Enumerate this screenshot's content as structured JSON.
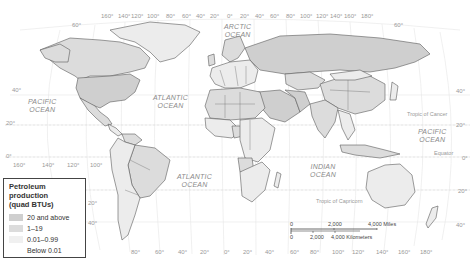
{
  "map": {
    "type": "world political map (petroleum production choropleth)",
    "colors": {
      "background": "#ffffff",
      "graticule": "#e4e4e4",
      "border": "#555555",
      "tier_20_and_above": "#cfcfcf",
      "tier_1_19": "#dcdcdc",
      "tier_001_099": "#ececec",
      "tier_below_001": "#ffffff"
    },
    "oceans": [
      {
        "name": "ARCTIC\nOCEAN",
        "line1": "ARCTIC",
        "line2": "OCEAN"
      },
      {
        "name": "PACIFIC OCEAN west",
        "line1": "PACIFIC",
        "line2": "OCEAN"
      },
      {
        "name": "ATLANTIC OCEAN north",
        "line1": "ATLANTIC",
        "line2": "OCEAN"
      },
      {
        "name": "PACIFIC OCEAN east",
        "line1": "PACIFIC",
        "line2": "OCEAN"
      },
      {
        "name": "ATLANTIC OCEAN south",
        "line1": "ATLANTIC",
        "line2": "OCEAN"
      },
      {
        "name": "INDIAN OCEAN",
        "line1": "INDIAN",
        "line2": "OCEAN"
      }
    ],
    "reference_lines": {
      "tropic_of_cancer": "Tropic of Cancer",
      "equator": "Equator",
      "tropic_of_capricorn": "Tropic of Capricorn"
    },
    "top_longitudes": [
      "160°",
      "140°",
      "120°",
      "100°",
      "80°",
      "60°",
      "40°",
      "20°",
      "0°",
      "20°",
      "40°",
      "60°",
      "80°",
      "100°",
      "120°",
      "140°",
      "160°",
      "180°"
    ],
    "bottom_longitudes_left": [
      "160°",
      "140°",
      "120°",
      "100°"
    ],
    "bottom_longitudes_right": [
      "80°",
      "60°",
      "40°",
      "20°",
      "0°",
      "20°",
      "40°",
      "60°",
      "80°",
      "100°",
      "120°",
      "140°",
      "160°",
      "180°"
    ],
    "latitudes_left": [
      "60°",
      "40°",
      "20°",
      "0°",
      "20°",
      "40°"
    ],
    "latitudes_right": [
      "60°",
      "40°",
      "20°",
      "0°",
      "20°",
      "40°"
    ]
  },
  "legend": {
    "title": "Petroleum production (quad BTUs)",
    "title_line1": "Petroleum production",
    "title_line2": "(quad BTUs)",
    "items": [
      {
        "label": "20 and above",
        "color": "#cfcfcf"
      },
      {
        "label": "1–19",
        "color": "#dcdcdc"
      },
      {
        "label": "0.01–0.99",
        "color": "#ececec"
      },
      {
        "label": "Below 0.01",
        "color": "#ffffff"
      }
    ]
  },
  "scale_bar": {
    "miles": {
      "start": "0",
      "mid": "2,000",
      "end": "4,000 Miles"
    },
    "kilometers": {
      "start": "0",
      "mid": "2,000",
      "end": "4,000 Kilometers"
    }
  }
}
